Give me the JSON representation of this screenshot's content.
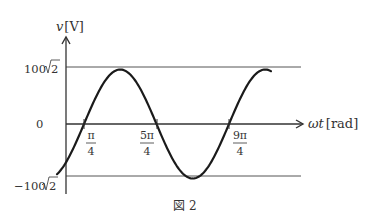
{
  "figure": {
    "caption": "図 2",
    "y_axis": {
      "var": "v",
      "unit": "[V]"
    },
    "x_axis": {
      "var": "ωt",
      "unit": "[rad]"
    },
    "y_ticks": {
      "max_num": "100",
      "max_rad": "2",
      "zero": "0",
      "min_num": "−100",
      "min_rad": "2"
    },
    "x_ticks": [
      {
        "num": "π",
        "den": "4"
      },
      {
        "num": "5π",
        "den": "4"
      },
      {
        "num": "9π",
        "den": "4"
      }
    ],
    "colors": {
      "curve": "#1a1a1a",
      "axis": "#333333",
      "ref_line": "#555555"
    }
  },
  "chart_data": {
    "type": "line",
    "title": "図 2",
    "function": "v = 100√2 · sin(ωt − π/4)",
    "xlabel": "ωt [rad]",
    "ylabel": "v [V]",
    "amplitude": "100√2",
    "zero_crossings": [
      "π/4",
      "5π/4",
      "9π/4"
    ],
    "peaks": [
      {
        "x": "3π/4",
        "y": "100√2"
      },
      {
        "x": "11π/4",
        "y": "100√2"
      }
    ],
    "troughs": [
      {
        "x": "7π/4",
        "y": "-100√2"
      }
    ],
    "x_range_rad": [
      -0.2,
      3.1
    ],
    "ylim": [
      "-100√2",
      "100√2"
    ],
    "grid": false,
    "reference_lines": [
      "100√2",
      "-100√2"
    ]
  }
}
